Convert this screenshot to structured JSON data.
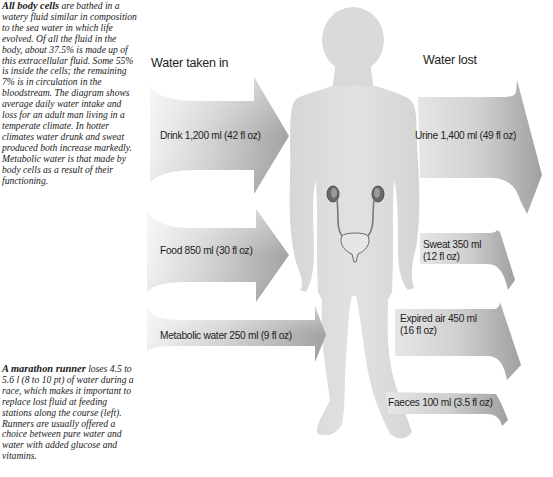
{
  "captions": {
    "top": {
      "lead": "All body cells",
      "text": " are bathed in a watery fluid similar in composition to the sea water in which life evolved. Of all the fluid in the body, about 37.5% is made up of this extracellular fluid. Some 55% is inside the cells; the remaining 7% is in circulation in the bloodstream. The diagram shows average daily water intake and loss for an adult man living in a temperate climate. In hotter climates water drunk and sweat produced both increase markedly. Metabolic water is that made by body cells as a result of their functioning."
    },
    "bottom": {
      "lead": "A marathon runner",
      "text": " loses 4.5 to 5.6 l (8 to 10 pt) of water during a race, which makes it important to replace lost fluid at feeding stations along the course (left). Runners are usually offered a choice between pure water and water with added glucose and vitamins."
    }
  },
  "headings": {
    "intake": "Water taken in",
    "loss": "Water lost"
  },
  "intake": [
    {
      "label": "Drink 1,200 ml (42 fl oz)",
      "source": "Drink",
      "ml": 1200,
      "fl_oz": 42
    },
    {
      "label": "Food 850 ml (30 fl oz)",
      "source": "Food",
      "ml": 850,
      "fl_oz": 30
    },
    {
      "label": "Metabolic water 250 ml (9 fl oz)",
      "source": "Metabolic water",
      "ml": 250,
      "fl_oz": 9
    }
  ],
  "loss": [
    {
      "label": "Urine 1,400 ml (49 fl oz)",
      "line1": "Urine 1,400 ml (49 fl oz)",
      "source": "Urine",
      "ml": 1400,
      "fl_oz": 49
    },
    {
      "line1": "Sweat 350 ml",
      "line2": "(12 fl oz)",
      "source": "Sweat",
      "ml": 350,
      "fl_oz": 12
    },
    {
      "line1": "Expired air 450 ml",
      "line2": "(16 fl oz)",
      "source": "Expired air",
      "ml": 450,
      "fl_oz": 16
    },
    {
      "line1": "Faeces 100 ml (3.5 fl oz)",
      "source": "Faeces",
      "ml": 100,
      "fl_oz": 3.5
    }
  ],
  "colors": {
    "figure": "#dedede",
    "arrow_light": "#eeeeee",
    "arrow_dark": "#a9a9a9",
    "kidney": "#5a5a5a"
  }
}
